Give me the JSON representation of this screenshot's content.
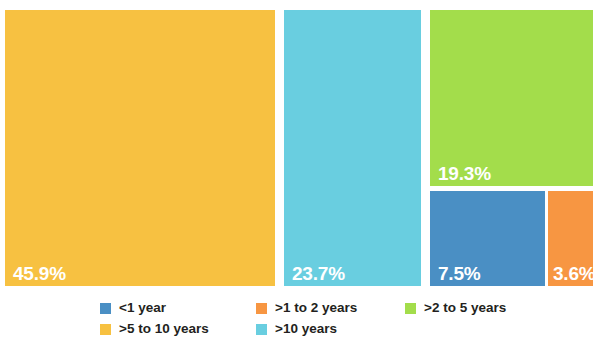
{
  "chart_data": {
    "type": "treemap",
    "title": "",
    "subtitle": "",
    "xlabel": "",
    "ylabel": "",
    "grid": false,
    "legend_position": "bottom",
    "value_unit": "percent",
    "categories": [
      ">5 to 10 years",
      ">10 years",
      ">2 to 5 years",
      "<1 year",
      ">1 to 2 years"
    ],
    "values": [
      45.9,
      23.7,
      19.3,
      7.5,
      3.6
    ],
    "tiles": [
      {
        "label": ">5 to 10 years",
        "value": 45.9,
        "value_label": "45.9%",
        "color": "#F7C141"
      },
      {
        "label": ">10 years",
        "value": 23.7,
        "value_label": "23.7%",
        "color": "#69CEE0"
      },
      {
        "label": ">2 to 5 years",
        "value": 19.3,
        "value_label": "19.3%",
        "color": "#A3DD4B"
      },
      {
        "label": "<1 year",
        "value": 7.5,
        "value_label": "7.5%",
        "color": "#4A8FC4"
      },
      {
        "label": ">1 to 2 years",
        "value": 3.6,
        "value_label": "3.6%",
        "color": "#F79642"
      }
    ],
    "legend": [
      {
        "label": "<1 year",
        "color": "#4A8FC4"
      },
      {
        "label": ">1 to 2 years",
        "color": "#F79642"
      },
      {
        "label": ">2 to 5 years",
        "color": "#A3DD4B"
      },
      {
        "label": ">5 to 10 years",
        "color": "#F7C141"
      },
      {
        "label": ">10 years",
        "color": "#69CEE0"
      }
    ]
  },
  "colors": {
    "background": "#FFFFFF",
    "label_text": "#FFFFFF",
    "legend_text": "#231F20",
    "yellow": "#F7C141",
    "cyan": "#69CEE0",
    "green": "#A3DD4B",
    "blue": "#4A8FC4",
    "orange": "#F79642"
  }
}
